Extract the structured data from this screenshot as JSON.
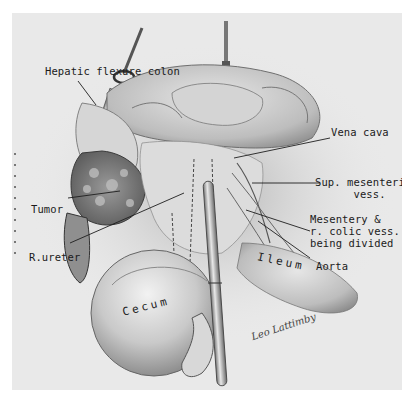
{
  "figure": {
    "type": "surgical illustration",
    "style": "grayscale pencil drawing",
    "background_color": "#e9e9e9",
    "ink_color": "#1b1b1b"
  },
  "labels": {
    "hepatic_flexure": "Hepatic flexure colon",
    "vena_cava": "Vena cava",
    "sup_mesenteric": "Sup. mesenteric\n      vess.",
    "tumor": "Tumor",
    "mesentery": "Mesentery &\nr. colic vess.\nbeing divided",
    "r_ureter": "R.ureter",
    "aorta": "Aorta",
    "ileum": "Ileum",
    "cecum": "Cecum"
  },
  "signature": "Leo Lattimby"
}
